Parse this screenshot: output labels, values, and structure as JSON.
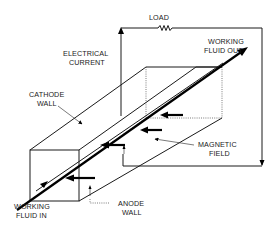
{
  "diagram": {
    "title": "",
    "labels": {
      "load": "LOAD",
      "electrical_current": [
        "ELECTRICAL",
        "CURRENT"
      ],
      "working_fluid_out": [
        "WORKING",
        "FLUID OUT"
      ],
      "cathode_wall": [
        "CATHODE",
        "WALL"
      ],
      "magnetic_field": [
        "MAGNETIC",
        "FIELD"
      ],
      "working_fluid_in": [
        "WORKING",
        "FLUID IN"
      ],
      "anode_wall": [
        "ANODE",
        "WALL"
      ]
    },
    "components": [
      {
        "id": "channel",
        "kind": "rectangular duct (isometric box)"
      },
      {
        "id": "load",
        "kind": "resistor in external circuit",
        "icon": "resistor-icon"
      },
      {
        "id": "current-loop",
        "kind": "external circuit wire with arrows"
      },
      {
        "id": "fluid-flow",
        "kind": "thick arrow through channel"
      },
      {
        "id": "magnetic-field-arrows",
        "kind": "horizontal arrows pointing left",
        "count": 4
      },
      {
        "id": "current-arrows",
        "kind": "small vertical arrows",
        "count": 2
      }
    ],
    "colors": {
      "ink": "#1a1a1a",
      "background": "#ffffff"
    }
  }
}
